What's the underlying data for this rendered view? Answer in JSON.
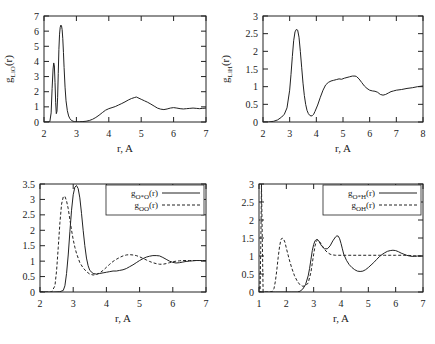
{
  "figure": {
    "title": "",
    "background": "#ffffff",
    "line_color": "#222222"
  },
  "chart_data": [
    {
      "id": "top-left",
      "type": "line",
      "title": "",
      "xlabel": "r, A",
      "ylabel": "g_LiO(r)",
      "ylabel_base": "g",
      "ylabel_sub": "LiO",
      "ylabel_tail": "(r)",
      "xlim": [
        2,
        7
      ],
      "ylim": [
        0,
        7
      ],
      "xticks": [
        2,
        3,
        4,
        5,
        6,
        7
      ],
      "yticks": [
        0,
        1,
        2,
        3,
        4,
        5,
        6,
        7
      ],
      "grid": false,
      "legend": null,
      "series": [
        {
          "name": "g_LiO(r)",
          "style": "solid",
          "x": [
            2.0,
            2.1,
            2.18,
            2.22,
            2.25,
            2.28,
            2.3,
            2.32,
            2.34,
            2.36,
            2.38,
            2.4,
            2.42,
            2.44,
            2.46,
            2.48,
            2.5,
            2.52,
            2.54,
            2.56,
            2.58,
            2.6,
            2.62,
            2.65,
            2.68,
            2.72,
            2.76,
            2.8,
            2.85,
            2.9,
            2.95,
            3.0,
            3.05,
            3.1,
            3.2,
            3.3,
            3.4,
            3.5,
            3.6,
            3.7,
            3.8,
            3.9,
            4.0,
            4.1,
            4.2,
            4.3,
            4.4,
            4.5,
            4.6,
            4.7,
            4.8,
            4.85,
            4.9,
            5.0,
            5.1,
            5.2,
            5.3,
            5.4,
            5.5,
            5.6,
            5.7,
            5.8,
            5.9,
            6.0,
            6.1,
            6.2,
            6.3,
            6.4,
            6.5,
            6.6,
            6.7,
            6.8,
            6.9,
            7.0
          ],
          "y": [
            0.0,
            0.0,
            0.02,
            0.6,
            2.2,
            3.5,
            3.9,
            3.7,
            2.6,
            1.3,
            0.55,
            0.7,
            1.6,
            3.2,
            4.8,
            5.8,
            6.25,
            6.4,
            6.35,
            6.1,
            5.5,
            4.6,
            3.6,
            2.3,
            1.4,
            0.75,
            0.4,
            0.22,
            0.1,
            0.05,
            0.02,
            0.01,
            0.01,
            0.02,
            0.03,
            0.05,
            0.1,
            0.18,
            0.3,
            0.45,
            0.62,
            0.78,
            0.88,
            0.95,
            1.02,
            1.12,
            1.22,
            1.33,
            1.45,
            1.55,
            1.62,
            1.65,
            1.6,
            1.5,
            1.4,
            1.3,
            1.18,
            1.05,
            0.92,
            0.85,
            0.82,
            0.86,
            0.92,
            0.95,
            0.92,
            0.88,
            0.86,
            0.88,
            0.9,
            0.92,
            0.9,
            0.88,
            0.9,
            0.92
          ]
        }
      ]
    },
    {
      "id": "top-right",
      "type": "line",
      "title": "",
      "xlabel": "r, A",
      "ylabel": "g_LiH(r)",
      "ylabel_base": "g",
      "ylabel_sub": "LiH",
      "ylabel_tail": "(r)",
      "xlim": [
        2,
        8
      ],
      "ylim": [
        0,
        3
      ],
      "xticks": [
        2,
        3,
        4,
        5,
        6,
        7,
        8
      ],
      "yticks": [
        0,
        0.5,
        1,
        1.5,
        2,
        2.5,
        3
      ],
      "ytick_labels": [
        "0",
        "0.5",
        "1",
        "1.5",
        "2",
        "2.5",
        "3"
      ],
      "grid": false,
      "legend": null,
      "series": [
        {
          "name": "g_LiH(r)",
          "style": "solid",
          "x": [
            2.0,
            2.2,
            2.4,
            2.55,
            2.7,
            2.8,
            2.9,
            3.0,
            3.05,
            3.1,
            3.15,
            3.2,
            3.25,
            3.3,
            3.35,
            3.4,
            3.45,
            3.5,
            3.55,
            3.6,
            3.65,
            3.7,
            3.75,
            3.8,
            3.85,
            3.9,
            3.95,
            4.05,
            4.15,
            4.25,
            4.35,
            4.45,
            4.55,
            4.65,
            4.75,
            4.85,
            4.95,
            5.05,
            5.15,
            5.25,
            5.35,
            5.45,
            5.5,
            5.6,
            5.7,
            5.8,
            5.9,
            6.0,
            6.1,
            6.2,
            6.3,
            6.4,
            6.5,
            6.6,
            6.7,
            6.8,
            6.9,
            7.0,
            7.2,
            7.4,
            7.6,
            7.8,
            8.0
          ],
          "y": [
            0.0,
            0.0,
            0.02,
            0.06,
            0.14,
            0.22,
            0.4,
            0.9,
            1.35,
            1.85,
            2.3,
            2.55,
            2.62,
            2.6,
            2.4,
            2.0,
            1.55,
            1.1,
            0.75,
            0.5,
            0.33,
            0.24,
            0.19,
            0.17,
            0.18,
            0.22,
            0.3,
            0.48,
            0.7,
            0.9,
            1.05,
            1.12,
            1.16,
            1.18,
            1.2,
            1.22,
            1.21,
            1.24,
            1.26,
            1.28,
            1.3,
            1.3,
            1.29,
            1.22,
            1.12,
            1.02,
            0.95,
            0.9,
            0.88,
            0.87,
            0.84,
            0.78,
            0.76,
            0.78,
            0.82,
            0.86,
            0.88,
            0.9,
            0.92,
            0.95,
            0.97,
            1.0,
            1.02
          ]
        }
      ]
    },
    {
      "id": "bottom-left",
      "type": "line",
      "title": "",
      "xlabel": "r, A",
      "ylabel": "",
      "xlim": [
        2,
        7
      ],
      "ylim": [
        0,
        3.5
      ],
      "xticks": [
        2,
        3,
        4,
        5,
        6,
        7
      ],
      "yticks": [
        0,
        0.5,
        1,
        1.5,
        2,
        2.5,
        3,
        3.5
      ],
      "ytick_labels": [
        "0",
        "0.5",
        "1",
        "1.5",
        "2",
        "2.5",
        "3",
        "3.5"
      ],
      "grid": false,
      "legend": {
        "position": "top-right",
        "entries": [
          {
            "label_base": "g",
            "label_sub": "O*O",
            "label_tail": "(r)",
            "style": "solid"
          },
          {
            "label_base": "g",
            "label_sub": "OO",
            "label_tail": "(r)",
            "style": "dashed"
          }
        ]
      },
      "series": [
        {
          "name": "g_O*O(r)",
          "style": "solid",
          "x": [
            2.0,
            2.4,
            2.6,
            2.7,
            2.75,
            2.8,
            2.85,
            2.9,
            2.95,
            3.0,
            3.05,
            3.1,
            3.15,
            3.2,
            3.25,
            3.3,
            3.35,
            3.4,
            3.45,
            3.5,
            3.6,
            3.7,
            3.8,
            3.9,
            4.0,
            4.1,
            4.2,
            4.3,
            4.4,
            4.5,
            4.6,
            4.7,
            4.8,
            4.9,
            5.0,
            5.1,
            5.2,
            5.3,
            5.4,
            5.5,
            5.6,
            5.7,
            5.8,
            5.9,
            6.0,
            6.1,
            6.2,
            6.3,
            6.4,
            6.5,
            6.6,
            6.7,
            6.8,
            6.9,
            7.0
          ],
          "y": [
            0.0,
            0.0,
            0.01,
            0.05,
            0.2,
            0.6,
            1.2,
            1.95,
            2.65,
            3.15,
            3.4,
            3.45,
            3.35,
            3.05,
            2.55,
            2.0,
            1.5,
            1.1,
            0.85,
            0.7,
            0.6,
            0.58,
            0.6,
            0.62,
            0.64,
            0.66,
            0.68,
            0.68,
            0.7,
            0.72,
            0.76,
            0.82,
            0.88,
            0.95,
            1.02,
            1.08,
            1.13,
            1.16,
            1.18,
            1.18,
            1.17,
            1.12,
            1.06,
            1.0,
            0.96,
            0.94,
            0.95,
            0.97,
            0.99,
            1.0,
            1.01,
            1.02,
            1.02,
            1.02,
            1.02
          ]
        },
        {
          "name": "g_OO(r)",
          "style": "dashed",
          "x": [
            2.0,
            2.35,
            2.45,
            2.5,
            2.55,
            2.6,
            2.65,
            2.7,
            2.75,
            2.8,
            2.85,
            2.9,
            2.95,
            3.0,
            3.05,
            3.1,
            3.2,
            3.3,
            3.4,
            3.5,
            3.6,
            3.7,
            3.8,
            3.9,
            4.0,
            4.1,
            4.2,
            4.3,
            4.4,
            4.5,
            4.6,
            4.7,
            4.8,
            4.9,
            5.0,
            5.1,
            5.2,
            5.3,
            5.4,
            5.5,
            5.6,
            5.7,
            5.8,
            5.9,
            6.0,
            6.1,
            6.2,
            6.3,
            6.4,
            6.5,
            6.6,
            6.7,
            6.8,
            6.9,
            7.0
          ],
          "y": [
            0.0,
            0.0,
            0.2,
            0.7,
            1.45,
            2.25,
            2.85,
            3.08,
            3.1,
            2.95,
            2.7,
            2.35,
            2.0,
            1.7,
            1.45,
            1.25,
            0.95,
            0.78,
            0.66,
            0.58,
            0.55,
            0.57,
            0.62,
            0.7,
            0.8,
            0.9,
            0.99,
            1.06,
            1.12,
            1.17,
            1.2,
            1.21,
            1.2,
            1.18,
            1.14,
            1.09,
            1.04,
            0.99,
            0.95,
            0.92,
            0.9,
            0.9,
            0.92,
            0.95,
            0.98,
            1.0,
            1.01,
            1.02,
            1.02,
            1.02,
            1.02,
            1.02,
            1.02,
            1.02,
            1.02
          ]
        }
      ]
    },
    {
      "id": "bottom-right",
      "type": "line",
      "title": "",
      "xlabel": "r, A",
      "ylabel": "",
      "xlim": [
        1,
        7
      ],
      "ylim": [
        0,
        3
      ],
      "xticks": [
        1,
        2,
        3,
        4,
        5,
        6,
        7
      ],
      "yticks": [
        0,
        0.5,
        1,
        1.5,
        2,
        2.5,
        3
      ],
      "ytick_labels": [
        "0",
        "0.5",
        "1",
        "1.5",
        "2",
        "2.5",
        "3"
      ],
      "grid": false,
      "legend": {
        "position": "top-right",
        "entries": [
          {
            "label_base": "g",
            "label_sub": "O*H",
            "label_tail": "(r)",
            "style": "solid"
          },
          {
            "label_base": "g",
            "label_sub": "OH",
            "label_tail": "(r)",
            "style": "dashed"
          }
        ]
      },
      "series": [
        {
          "name": "g_O*H(r)",
          "style": "solid",
          "x": [
            1.0,
            1.4,
            1.6,
            1.8,
            2.0,
            2.2,
            2.4,
            2.5,
            2.6,
            2.7,
            2.8,
            2.85,
            2.9,
            2.95,
            3.0,
            3.05,
            3.1,
            3.15,
            3.2,
            3.25,
            3.3,
            3.4,
            3.5,
            3.6,
            3.7,
            3.8,
            3.85,
            3.9,
            3.95,
            4.0,
            4.05,
            4.1,
            4.2,
            4.3,
            4.4,
            4.5,
            4.6,
            4.7,
            4.8,
            4.9,
            5.0,
            5.1,
            5.2,
            5.3,
            5.4,
            5.5,
            5.6,
            5.7,
            5.8,
            5.9,
            6.0,
            6.1,
            6.2,
            6.3,
            6.4,
            6.5,
            6.6,
            6.7,
            6.8,
            6.9,
            7.0
          ],
          "y": [
            0.0,
            0.0,
            0.0,
            0.0,
            0.0,
            0.0,
            0.0,
            0.02,
            0.08,
            0.2,
            0.45,
            0.65,
            0.9,
            1.15,
            1.32,
            1.42,
            1.46,
            1.45,
            1.4,
            1.33,
            1.27,
            1.2,
            1.2,
            1.28,
            1.42,
            1.53,
            1.56,
            1.55,
            1.48,
            1.35,
            1.2,
            1.05,
            0.88,
            0.76,
            0.68,
            0.62,
            0.58,
            0.57,
            0.58,
            0.62,
            0.68,
            0.75,
            0.82,
            0.9,
            0.98,
            1.04,
            1.09,
            1.13,
            1.15,
            1.16,
            1.15,
            1.12,
            1.08,
            1.05,
            1.02,
            1.0,
            0.99,
            0.99,
            1.0,
            1.0,
            1.0
          ]
        },
        {
          "name": "g_OH(r)",
          "style": "dashed",
          "x": [
            0.9,
            0.93,
            0.95,
            0.97,
            1.0,
            1.04,
            1.07,
            1.09,
            1.12,
            1.15,
            1.2,
            1.3,
            1.4,
            1.5,
            1.55,
            1.6,
            1.65,
            1.7,
            1.75,
            1.8,
            1.85,
            1.9,
            1.95,
            2.0,
            2.1,
            2.2,
            2.3,
            2.4,
            2.5,
            2.6,
            2.7,
            2.8,
            2.9,
            2.95,
            3.0,
            3.05,
            3.1,
            3.15,
            3.2,
            3.3,
            3.4,
            3.5,
            3.6,
            3.7,
            3.8,
            3.9,
            4.0,
            4.2,
            4.4,
            4.6,
            4.8,
            5.0,
            5.2,
            5.4,
            5.6,
            5.8,
            6.0,
            6.2,
            6.4,
            6.6,
            6.8,
            7.0
          ],
          "y": [
            0.0,
            1.5,
            3.0,
            1.5,
            0.0,
            0.0,
            1.5,
            3.0,
            1.5,
            0.0,
            0.0,
            0.0,
            0.0,
            0.02,
            0.1,
            0.3,
            0.6,
            0.95,
            1.25,
            1.45,
            1.5,
            1.47,
            1.38,
            1.22,
            0.92,
            0.66,
            0.45,
            0.3,
            0.2,
            0.16,
            0.17,
            0.25,
            0.55,
            0.8,
            1.05,
            1.28,
            1.42,
            1.45,
            1.42,
            1.3,
            1.18,
            1.1,
            1.05,
            1.03,
            1.02,
            1.02,
            1.02,
            1.02,
            1.02,
            1.02,
            1.02,
            1.02,
            1.02,
            1.02,
            1.02,
            1.02,
            1.02,
            1.02,
            1.02,
            1.01,
            1.0,
            1.0
          ]
        }
      ]
    }
  ]
}
